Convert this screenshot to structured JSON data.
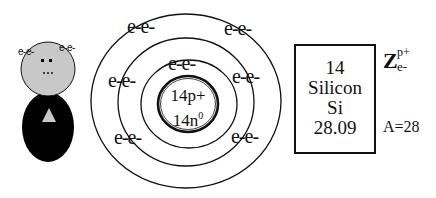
{
  "diagram": {
    "type": "bohr-model",
    "element": {
      "atomic_number": "14",
      "name": "Silicon",
      "symbol": "Si",
      "atomic_mass": "28.09",
      "mass_number_label": "A=28",
      "z_label": "Z",
      "z_superscript": "p+",
      "z_subscript": "e-"
    },
    "nucleus": {
      "protons_label": "14p+",
      "neutrons_label": "14n",
      "neutrons_superscript": "0"
    },
    "shells": {
      "inner": [
        "e-e-"
      ],
      "middle": [
        "e-e-",
        "e-e-",
        "e-e-"
      ],
      "outer": [
        "e-e-",
        "e-e-",
        "e-e-",
        "e-e-"
      ]
    },
    "shell_labels": [
      "e-e-",
      "e-e-",
      "e-e-",
      "e-e-",
      "e-e-",
      "e-e-",
      "e-e-"
    ],
    "lewis_figure": {
      "head_labels": [
        "e-e-",
        "e-e-"
      ],
      "head_color": "#c8c8c8",
      "body_color": "#000000",
      "triangle_color": "#c8c8c8"
    }
  }
}
